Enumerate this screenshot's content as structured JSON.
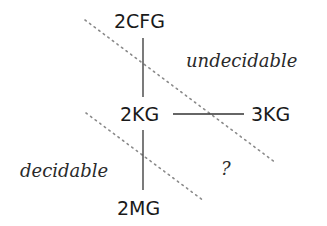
{
  "nodes": {
    "n2cfg": {
      "label": "2CFG"
    },
    "n2kg": {
      "label": "2KG"
    },
    "n3kg": {
      "label": "3KG"
    },
    "n2mg": {
      "label": "2MG"
    }
  },
  "regions": {
    "undecidable": {
      "label": "undecidable"
    },
    "decidable": {
      "label": "decidable"
    },
    "unknown": {
      "label": "?"
    }
  },
  "edges": [
    {
      "from": "2CFG",
      "to": "2KG",
      "style": "solid"
    },
    {
      "from": "2KG",
      "to": "2MG",
      "style": "solid"
    },
    {
      "from": "2KG",
      "to": "3KG",
      "style": "solid"
    }
  ],
  "boundaries": [
    {
      "name": "undecidable-boundary",
      "style": "dotted"
    },
    {
      "name": "decidable-boundary",
      "style": "dotted"
    }
  ],
  "colors": {
    "line": "#333333",
    "dotted": "#888888",
    "text": "#1a1a1a",
    "background": "#ffffff"
  }
}
